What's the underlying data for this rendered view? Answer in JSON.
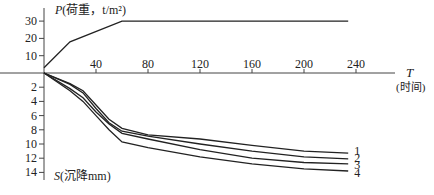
{
  "chart_data": [
    {
      "type": "line",
      "title": "",
      "xlabel": "T (时间)",
      "ylabel": "P(荷重，t/m²)",
      "x_ticks": [
        40,
        80,
        120,
        160,
        200,
        240
      ],
      "y_ticks": [
        10,
        20,
        30
      ],
      "xlim": [
        0,
        260
      ],
      "ylim": [
        0,
        35
      ],
      "grid": false,
      "series": [
        {
          "name": "P",
          "x": [
            0,
            20,
            60,
            234
          ],
          "values": [
            3,
            18,
            30,
            30
          ]
        }
      ]
    },
    {
      "type": "line",
      "title": "",
      "xlabel": "T (时间)",
      "ylabel": "S(沉降mm)",
      "x_ticks": [
        40,
        80,
        120,
        160,
        200,
        240
      ],
      "y_ticks": [
        2,
        4,
        6,
        8,
        10,
        12,
        14
      ],
      "xlim": [
        0,
        260
      ],
      "ylim": [
        0,
        15
      ],
      "y_inverted": true,
      "grid": false,
      "legend_position": "right-end labels",
      "series": [
        {
          "name": "1",
          "x": [
            0,
            20,
            30,
            40,
            50,
            60,
            80,
            120,
            160,
            200,
            234
          ],
          "values": [
            0,
            1.5,
            2.5,
            4.5,
            6.5,
            7.8,
            8.7,
            9.3,
            10.2,
            11.0,
            11.3
          ]
        },
        {
          "name": "2",
          "x": [
            0,
            20,
            30,
            40,
            50,
            60,
            80,
            120,
            160,
            200,
            234
          ],
          "values": [
            0,
            1.6,
            2.8,
            5.0,
            7.0,
            8.2,
            8.9,
            10.0,
            11.0,
            11.8,
            12.1
          ]
        },
        {
          "name": "3",
          "x": [
            0,
            20,
            30,
            40,
            50,
            60,
            80,
            120,
            160,
            200,
            234
          ],
          "values": [
            0,
            2.2,
            3.5,
            5.5,
            7.2,
            8.5,
            9.3,
            10.8,
            12.0,
            12.6,
            12.8
          ]
        },
        {
          "name": "4",
          "x": [
            0,
            20,
            30,
            40,
            50,
            60,
            80,
            120,
            160,
            200,
            234
          ],
          "values": [
            0,
            2.5,
            4.0,
            6.0,
            8.0,
            9.7,
            10.5,
            11.8,
            12.8,
            13.5,
            13.8
          ]
        }
      ]
    }
  ],
  "labels": {
    "p_axis": "P(荷重，t/m²)",
    "p_axis_italic": "P",
    "p_axis_rest": "(荷重，t/m²)",
    "t_axis": "T",
    "t_axis_sub": "(时间)",
    "s_axis_italic": "S",
    "s_axis_rest": "(沉降mm)",
    "x_ticks": [
      "40",
      "80",
      "120",
      "160",
      "200",
      "240"
    ],
    "p_ticks": [
      "30",
      "20",
      "10"
    ],
    "s_ticks": [
      "2",
      "4",
      "6",
      "8",
      "10",
      "12",
      "14"
    ],
    "series_labels": [
      "1",
      "2",
      "3",
      "4"
    ]
  },
  "colors": {
    "line": "#222222",
    "axis": "#444444"
  }
}
